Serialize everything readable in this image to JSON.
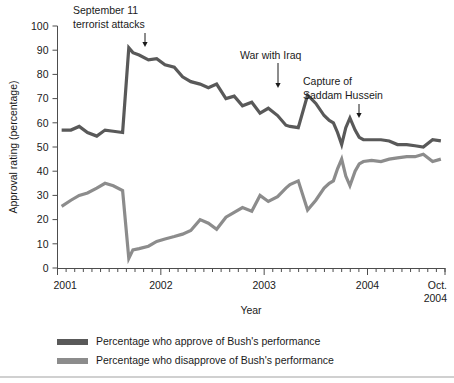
{
  "chart_data": {
    "type": "line",
    "title": "",
    "xlabel": "Year",
    "ylabel": "Approval rating (percentage)",
    "ylim": [
      0,
      100
    ],
    "ytick_labels": [
      "0",
      "10",
      "20",
      "30",
      "40",
      "50",
      "60",
      "70",
      "80",
      "90",
      "100"
    ],
    "ytick_values": [
      0,
      10,
      20,
      30,
      40,
      50,
      60,
      70,
      80,
      90,
      100
    ],
    "xtick_labels": [
      "2001",
      "2002",
      "2003",
      "2004",
      "Oct. 2004"
    ],
    "xtick_values": [
      2001.0,
      2002.0,
      2003.0,
      2004.0,
      2004.75
    ],
    "xlim": [
      2001.0,
      2004.75
    ],
    "grid": false,
    "legend_position": "below-axes-left",
    "series": [
      {
        "name": "Percentage who approve of Bush's performance",
        "color": "#595959",
        "x": [
          2001.04,
          2001.13,
          2001.21,
          2001.29,
          2001.38,
          2001.46,
          2001.54,
          2001.63,
          2001.69,
          2001.73,
          2001.79,
          2001.88,
          2001.96,
          2002.04,
          2002.13,
          2002.21,
          2002.29,
          2002.38,
          2002.46,
          2002.54,
          2002.63,
          2002.71,
          2002.79,
          2002.88,
          2002.96,
          2003.04,
          2003.13,
          2003.21,
          2003.25,
          2003.33,
          2003.42,
          2003.5,
          2003.58,
          2003.63,
          2003.67,
          2003.71,
          2003.75,
          2003.79,
          2003.83,
          2003.88,
          2003.92,
          2003.96,
          2004.04,
          2004.13,
          2004.21,
          2004.29,
          2004.38,
          2004.46,
          2004.54,
          2004.63,
          2004.71
        ],
        "y": [
          57,
          57,
          58.5,
          56,
          54.5,
          57,
          56.5,
          56,
          91,
          89,
          88,
          86,
          86.5,
          84,
          83,
          79,
          77,
          76,
          74.5,
          76,
          70,
          71,
          67,
          68.5,
          64,
          66,
          63,
          59,
          58.5,
          58,
          71.5,
          68,
          63,
          61,
          60,
          56,
          51,
          58,
          62,
          57,
          54,
          53,
          53,
          53,
          52.5,
          51,
          51,
          50.5,
          50,
          53,
          52.5
        ]
      },
      {
        "name": "Percentage who disapprove of Bush's performance",
        "color": "#8c8c8c",
        "x": [
          2001.04,
          2001.13,
          2001.21,
          2001.29,
          2001.38,
          2001.46,
          2001.54,
          2001.63,
          2001.69,
          2001.73,
          2001.79,
          2001.88,
          2001.96,
          2002.04,
          2002.13,
          2002.21,
          2002.29,
          2002.38,
          2002.46,
          2002.54,
          2002.63,
          2002.71,
          2002.79,
          2002.88,
          2002.96,
          2003.04,
          2003.13,
          2003.21,
          2003.25,
          2003.33,
          2003.42,
          2003.5,
          2003.58,
          2003.63,
          2003.67,
          2003.71,
          2003.75,
          2003.79,
          2003.83,
          2003.88,
          2003.92,
          2003.96,
          2004.04,
          2004.13,
          2004.21,
          2004.29,
          2004.38,
          2004.46,
          2004.54,
          2004.63,
          2004.71
        ],
        "y": [
          25.5,
          28,
          30,
          31,
          33,
          35,
          34,
          32,
          4,
          7.5,
          8,
          9,
          11,
          12,
          13,
          14,
          15.5,
          20,
          18.5,
          16,
          21,
          23,
          25,
          23.5,
          30,
          27.5,
          29.5,
          33,
          34.5,
          36,
          24,
          28,
          33,
          35,
          36,
          41,
          45,
          38,
          34,
          40,
          43,
          44,
          44.5,
          44,
          45,
          45.5,
          46,
          46,
          47,
          44,
          45
        ]
      }
    ],
    "annotations": [
      {
        "label_lines": [
          "September 11",
          "terrorist attacks"
        ],
        "x": 2001.69,
        "y": 91,
        "text_x": 73,
        "text_y": 14,
        "arrow_x": 145,
        "arrow_top": 33,
        "arrow_bottom": 47
      },
      {
        "label_lines": [
          "War with Iraq"
        ],
        "x": 2003.42,
        "y": 71.5,
        "text_x": 240,
        "text_y": 59,
        "arrow_x": 278,
        "arrow_top": 63,
        "arrow_bottom": 88
      },
      {
        "label_lines": [
          "Capture of",
          "Saddam Hussein"
        ],
        "x": 2003.83,
        "y": 62,
        "text_x": 303,
        "text_y": 85,
        "arrow_x": 359,
        "arrow_top": 104,
        "arrow_bottom": 118
      }
    ]
  }
}
